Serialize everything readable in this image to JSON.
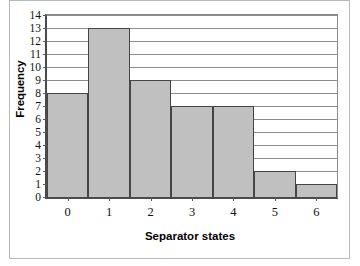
{
  "chart_data": {
    "type": "bar",
    "title": "",
    "subtitle": "",
    "xlabel": "Separator states",
    "ylabel": "Frequency",
    "categories": [
      "0",
      "1",
      "2",
      "3",
      "4",
      "5",
      "6"
    ],
    "values": [
      8,
      13,
      9,
      7,
      7,
      2,
      1
    ],
    "series": [
      {
        "name": "Frequency",
        "values": [
          8,
          13,
          9,
          7,
          7,
          2,
          1
        ]
      }
    ],
    "ylim": [
      0,
      14
    ],
    "ytick_labels": [
      "0",
      "1",
      "2",
      "3",
      "4",
      "5",
      "6",
      "7",
      "8",
      "9",
      "10",
      "11",
      "12",
      "13",
      "14"
    ],
    "ytick_values": [
      0,
      1,
      2,
      3,
      4,
      5,
      6,
      7,
      8,
      9,
      10,
      11,
      12,
      13,
      14
    ],
    "xtick_labels": [
      "0",
      "1",
      "2",
      "3",
      "4",
      "5",
      "6"
    ],
    "grid": true,
    "grid_axis": "y",
    "legend": false,
    "legend_position": "none",
    "bar_fill_color": "#c0c0c0",
    "bar_edge_color": "#454545",
    "grid_color": "#8d8d8d",
    "axis_color": "#4a4a4a",
    "background_color": "#ffffff",
    "frame_color": "#b9b9b9",
    "annotations": []
  }
}
